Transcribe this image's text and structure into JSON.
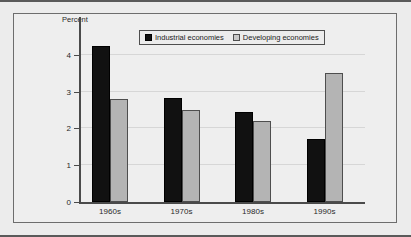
{
  "chart_data": {
    "type": "bar",
    "title": "",
    "subtitle": "",
    "xlabel": "",
    "ylabel": "Percent",
    "categories": [
      "1960s",
      "1970s",
      "1980s",
      "1990s"
    ],
    "series": [
      {
        "name": "Industrial economies",
        "color": "#111111",
        "values": [
          4.25,
          2.83,
          2.44,
          1.7
        ]
      },
      {
        "name": "Developing economies",
        "color": "#b4b4b4",
        "values": [
          2.8,
          2.5,
          2.19,
          3.5
        ]
      }
    ],
    "ylim": [
      0,
      4.4
    ],
    "yticks": [
      0,
      1,
      2,
      3,
      4
    ],
    "ytick_labels": [
      "0",
      "1",
      "2",
      "3",
      "4"
    ],
    "grid": true,
    "legend_position": "top-center"
  },
  "legend": {
    "entries": [
      {
        "label": "Industrial economies",
        "swatch": "filled-black-square"
      },
      {
        "label": "Developing economies",
        "swatch": "filled-gray-square"
      }
    ]
  },
  "colors": {
    "figure_background": "#ececec",
    "plot_background": "#eeeeee",
    "axis": "#4a4a4a",
    "gridline": "#d6d6d6",
    "frame": "#6d6d6d",
    "industrial_bar": "#111111",
    "developing_bar": "#b4b4b4"
  }
}
